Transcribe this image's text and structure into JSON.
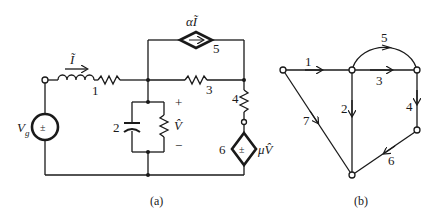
{
  "figure_a": {
    "caption": "(a)",
    "source_label": "V",
    "source_sub": "g",
    "source_symbol": "±",
    "current_label": "Ĩ",
    "elements": {
      "e1": "1",
      "e2": "2",
      "e3": "3",
      "e4": "4",
      "e5": "5",
      "e6": "6"
    },
    "voltage_label": "V̂",
    "plus": "+",
    "minus": "−",
    "dep_current_label": "αĨ",
    "dep_voltage_label": "μV̂",
    "dep_voltage_symbol": "±"
  },
  "figure_b": {
    "caption": "(b)",
    "branches": [
      "1",
      "2",
      "3",
      "4",
      "5",
      "6",
      "7"
    ]
  }
}
